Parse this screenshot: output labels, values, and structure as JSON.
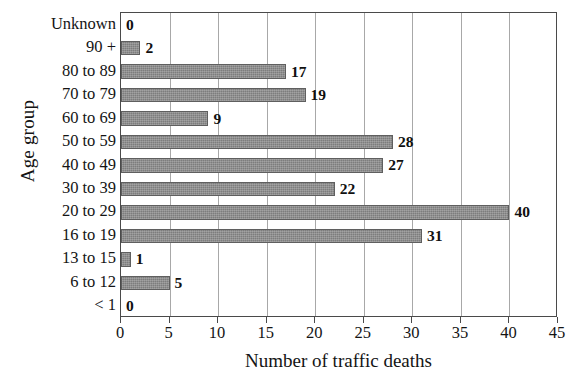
{
  "chart_data": {
    "type": "bar",
    "orientation": "horizontal",
    "title": "",
    "xlabel": "Number of traffic deaths",
    "ylabel": "Age group",
    "xlim": [
      0,
      45
    ],
    "xticks": [
      0,
      5,
      10,
      15,
      20,
      25,
      30,
      35,
      40,
      45
    ],
    "grid": true,
    "legend": null,
    "categories": [
      "Unknown",
      "90 +",
      "80 to 89",
      "70 to 79",
      "60 to 69",
      "50 to 59",
      "40 to 49",
      "30 to 39",
      "20 to 29",
      "16 to 19",
      "13 to 15",
      "6 to 12",
      "< 1"
    ],
    "values": [
      0,
      2,
      17,
      19,
      9,
      28,
      27,
      22,
      40,
      31,
      1,
      5,
      0
    ],
    "value_labels": [
      "0",
      "2",
      "17",
      "19",
      "9",
      "28",
      "27",
      "22",
      "40",
      "31",
      "1",
      "5",
      "0"
    ],
    "bar_color": "#7d7d7d",
    "bar_edge_color": "#5f5f5f",
    "gridline_color": "#a8a8a8",
    "axis_color": "#4a4a4a",
    "background_color": "#ffffff"
  }
}
